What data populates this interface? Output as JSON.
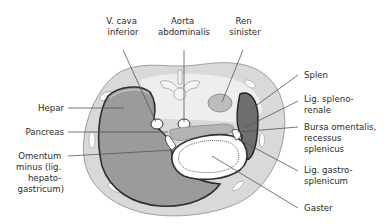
{
  "diagram": {
    "colors": {
      "body_wall": "#d9d9d9",
      "retroperitoneum": "#eeeeee",
      "liver": "#9b9b9b",
      "spleen": "#6e6e6e",
      "pancreas": "#b4b4b4",
      "kidney": "#bdbdbd",
      "stomach_wall": "#ffffff",
      "outline": "#3a3a3a",
      "label_text": "#2a2a2a"
    },
    "labels": {
      "top": [
        {
          "id": "vcava",
          "lines": [
            "V. cava",
            "inferior"
          ]
        },
        {
          "id": "aorta",
          "lines": [
            "Aorta",
            "abdominalis"
          ]
        },
        {
          "id": "ren",
          "lines": [
            "Ren",
            "sinister"
          ]
        }
      ],
      "left": [
        {
          "id": "hepar",
          "lines": [
            "Hepar"
          ]
        },
        {
          "id": "pancreas",
          "lines": [
            "Pancreas"
          ]
        },
        {
          "id": "omentum",
          "lines": [
            "Omentum",
            "minus (lig.",
            "hepato-",
            "gastricum)"
          ]
        }
      ],
      "right": [
        {
          "id": "splen",
          "lines": [
            "Splen"
          ]
        },
        {
          "id": "lig_splenorenale",
          "lines": [
            "Lig. spleno-",
            "renale"
          ]
        },
        {
          "id": "bursa",
          "lines": [
            "Bursa omentalis,",
            "recessus",
            "splenicus"
          ]
        },
        {
          "id": "lig_gastrosplenicum",
          "lines": [
            "Lig. gastro-",
            "splenicum"
          ]
        },
        {
          "id": "gaster",
          "lines": [
            "Gaster"
          ]
        }
      ]
    }
  }
}
